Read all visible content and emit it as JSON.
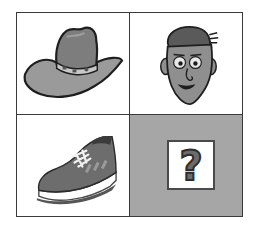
{
  "puzzle": {
    "type": "2x2 picture analogy grid",
    "cells": [
      {
        "position": "top-left",
        "content": "cowboy hat"
      },
      {
        "position": "top-right",
        "content": "cartoon man face"
      },
      {
        "position": "bottom-left",
        "content": "sneaker shoe"
      },
      {
        "position": "bottom-right",
        "content": "unknown",
        "symbol": "?"
      }
    ],
    "colors": {
      "grid_border": "#3a3a3a",
      "unknown_cell_bg": "#a6a6a6",
      "object_fill": "#8a8a8a",
      "outline": "#222222"
    }
  }
}
